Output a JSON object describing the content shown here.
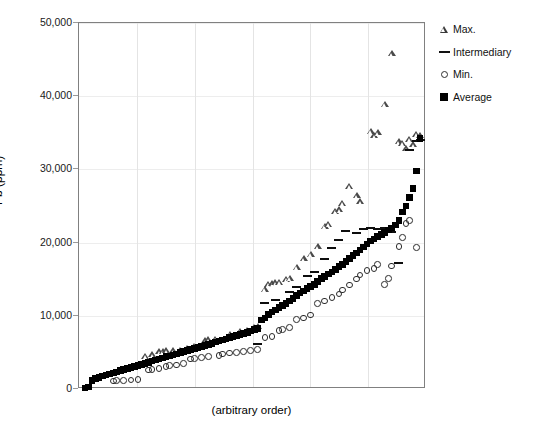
{
  "chart_data": {
    "type": "scatter",
    "title": "",
    "xlabel": "(arbitrary order)",
    "ylabel": "Pb (ppm)",
    "ylim": [
      0,
      50000
    ],
    "yticks": [
      0,
      10000,
      20000,
      30000,
      40000,
      50000
    ],
    "ytick_labels": [
      "0",
      "10,000",
      "20,000",
      "30,000",
      "40,000",
      "50,000"
    ],
    "xticks": [],
    "xtick_labels": [],
    "grid": true,
    "legend_position": "top-right",
    "legend": [
      "Max.",
      "Intermediary",
      "Min.",
      "Average"
    ],
    "n_samples": 96,
    "series": [
      {
        "name": "Average",
        "marker": "filled-square",
        "values": [
          150,
          300,
          1150,
          1400,
          1600,
          1750,
          1900,
          2050,
          2200,
          2350,
          2500,
          2650,
          2800,
          2950,
          3050,
          3200,
          3350,
          3500,
          3650,
          3800,
          3950,
          4100,
          4250,
          4400,
          4500,
          4650,
          4800,
          4950,
          5100,
          5250,
          5400,
          5500,
          5650,
          5800,
          5950,
          6100,
          6250,
          6400,
          6550,
          6700,
          6850,
          7000,
          7150,
          7300,
          7450,
          7600,
          7750,
          7900,
          8100,
          8300,
          9400,
          9700,
          10200,
          10500,
          10800,
          11100,
          11400,
          11700,
          12000,
          12400,
          12800,
          13100,
          13400,
          13700,
          14000,
          14300,
          14700,
          15100,
          15400,
          15700,
          16000,
          16300,
          16700,
          17000,
          17400,
          17800,
          18200,
          18600,
          19000,
          19400,
          19800,
          20200,
          20500,
          20800,
          21100,
          21400,
          21700,
          22000,
          22400,
          23000,
          24200,
          25000,
          26200,
          27400,
          29800,
          34200
        ]
      },
      {
        "name": "Max.",
        "marker": "open-triangle",
        "values": [
          null,
          null,
          null,
          null,
          null,
          null,
          null,
          null,
          null,
          null,
          null,
          null,
          null,
          null,
          null,
          null,
          null,
          4500,
          null,
          4700,
          null,
          5100,
          5100,
          5200,
          null,
          5200,
          null,
          5300,
          null,
          5600,
          null,
          5800,
          null,
          null,
          6600,
          6700,
          null,
          6800,
          null,
          null,
          null,
          7500,
          null,
          null,
          7900,
          null,
          8000,
          null,
          8400,
          8600,
          null,
          13600,
          14300,
          14400,
          14500,
          14600,
          null,
          15000,
          15100,
          null,
          16600,
          null,
          17800,
          null,
          18400,
          null,
          19400,
          null,
          22200,
          22500,
          null,
          24300,
          24500,
          25400,
          null,
          27700,
          null,
          26400,
          25600,
          null,
          null,
          35200,
          34600,
          35000,
          null,
          38900,
          null,
          45800,
          null,
          33800,
          33600,
          32800,
          34100,
          33400,
          34800,
          34600
        ]
      },
      {
        "name": "Min.",
        "marker": "open-circle",
        "values": [
          null,
          null,
          null,
          null,
          null,
          null,
          null,
          null,
          1100,
          1150,
          null,
          1200,
          null,
          1250,
          null,
          1300,
          null,
          null,
          2600,
          2700,
          null,
          2800,
          null,
          3100,
          3200,
          null,
          3300,
          null,
          3500,
          null,
          4100,
          4200,
          null,
          4300,
          null,
          4400,
          null,
          null,
          4600,
          4800,
          null,
          4900,
          null,
          5000,
          null,
          5100,
          null,
          5300,
          null,
          5400,
          null,
          7000,
          null,
          7200,
          null,
          8000,
          8100,
          null,
          8400,
          null,
          9500,
          null,
          9700,
          null,
          10100,
          null,
          11700,
          null,
          12000,
          null,
          12500,
          null,
          13000,
          13500,
          null,
          14200,
          null,
          15000,
          15600,
          null,
          16200,
          null,
          16500,
          17000,
          null,
          14300,
          15100,
          16800,
          null,
          19500,
          20700,
          22600,
          23000,
          null,
          19300,
          null
        ]
      },
      {
        "name": "Intermediary",
        "marker": "dash",
        "values": [
          null,
          null,
          null,
          null,
          null,
          null,
          null,
          null,
          null,
          null,
          null,
          null,
          null,
          null,
          null,
          null,
          null,
          null,
          null,
          null,
          null,
          null,
          null,
          null,
          null,
          null,
          null,
          null,
          null,
          null,
          null,
          null,
          null,
          null,
          null,
          null,
          null,
          null,
          null,
          null,
          null,
          null,
          null,
          null,
          null,
          null,
          null,
          null,
          null,
          6200,
          null,
          11800,
          null,
          null,
          12100,
          null,
          null,
          null,
          13300,
          null,
          14000,
          null,
          null,
          15500,
          null,
          16000,
          null,
          null,
          17800,
          null,
          19200,
          null,
          20400,
          null,
          21600,
          null,
          null,
          21300,
          null,
          21800,
          null,
          22000,
          null,
          21900,
          null,
          22000,
          null,
          21500,
          null,
          17200,
          null,
          null,
          32600,
          null,
          33900,
          34000
        ]
      }
    ]
  },
  "caption": "",
  "colors": {
    "frame": "#808080",
    "grid": "#e4e4e4",
    "marker_dark": "#000000",
    "marker_outline": "#2e2e2e"
  }
}
